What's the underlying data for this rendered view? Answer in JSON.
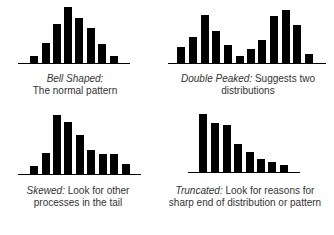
{
  "chart_data": [
    {
      "type": "bar",
      "name": "bell-shaped",
      "title_term": "Bell Shaped:",
      "title_desc": "",
      "line2": "The normal pattern",
      "values": [
        7,
        20,
        39,
        56,
        45,
        35,
        19,
        7
      ],
      "ylim": [
        0,
        60
      ],
      "grid": false,
      "legend": "none",
      "layout": {
        "baseline_y": 63,
        "axis_x": [
          18,
          130
        ],
        "bar_x": [
          30,
          42,
          53,
          64,
          75,
          87,
          98,
          110
        ],
        "bar_w": 8
      }
    },
    {
      "type": "bar",
      "name": "double-peaked",
      "title_term": "Double Peaked:",
      "title_desc": " Suggests two",
      "line2": "distributions",
      "values": [
        16,
        26,
        48,
        32,
        18,
        7,
        14,
        23,
        47,
        53,
        38,
        9
      ],
      "ylim": [
        0,
        60
      ],
      "grid": false,
      "legend": "none",
      "layout": {
        "baseline_y": 63,
        "axis_x": [
          168,
          326
        ],
        "bar_x": [
          177,
          189,
          201,
          212,
          224,
          236,
          247,
          258,
          270,
          282,
          293,
          305
        ],
        "bar_w": 8
      }
    },
    {
      "type": "bar",
      "name": "skewed",
      "title_term": "Skewed:",
      "title_desc": "  Look for other",
      "line2": "processes in the tail",
      "values": [
        8,
        21,
        59,
        52,
        39,
        24,
        20,
        20,
        10
      ],
      "ylim": [
        0,
        60
      ],
      "grid": false,
      "legend": "none",
      "layout": {
        "baseline_y": 174,
        "axis_x": [
          18,
          141
        ],
        "bar_x": [
          30,
          42,
          53,
          64,
          76,
          87,
          99,
          110,
          122
        ],
        "bar_w": 8
      }
    },
    {
      "type": "bar",
      "name": "truncated",
      "title_term": "Truncated:",
      "title_desc": "  Look for reasons for",
      "line2": "sharp end of distribution or pattern",
      "values": [
        58,
        49,
        47,
        28,
        20,
        13,
        10,
        7
      ],
      "ylim": [
        0,
        60
      ],
      "grid": false,
      "legend": "none",
      "layout": {
        "baseline_y": 172,
        "axis_x": [
          188,
          300
        ],
        "bar_x": [
          199,
          211,
          223,
          234,
          246,
          257,
          268,
          280
        ],
        "bar_w": 8
      }
    }
  ],
  "colors": {
    "bar": "#000000",
    "axis": "#000000",
    "text": "#333333"
  }
}
